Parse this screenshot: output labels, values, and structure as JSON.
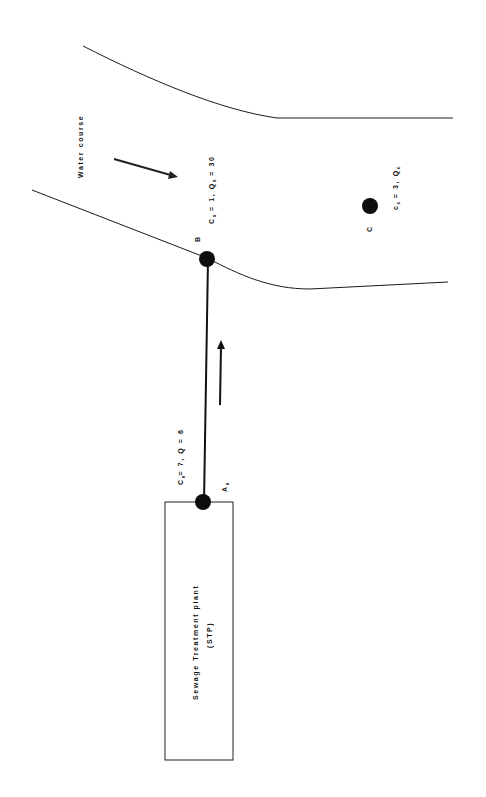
{
  "diagram": {
    "water_course_label": "Water course",
    "stp_label_line1": "Sewage Treatment plant",
    "stp_label_line2": "(STP)",
    "points": {
      "A": {
        "name": "A",
        "sub": "e"
      },
      "B": {
        "name": "B"
      },
      "C": {
        "name": "C"
      }
    },
    "labels": {
      "effluent": {
        "c": "C",
        "c_sub": "e",
        "text1": "= 7, ",
        "q": "Q",
        "text2": " = 6"
      },
      "upstream": {
        "c": "C",
        "c_sub": "s",
        "text1": " = 1, ",
        "q": "Q",
        "q_sub": "s",
        "text2": " = 30"
      },
      "downstream": {
        "c": "c",
        "c_sub": "c",
        "text1": " = 3, ",
        "q": "Q",
        "q_sub": "c"
      }
    },
    "colors": {
      "line": "#1a1a1a",
      "node": "#0d0d0d",
      "background": "#ffffff"
    }
  }
}
